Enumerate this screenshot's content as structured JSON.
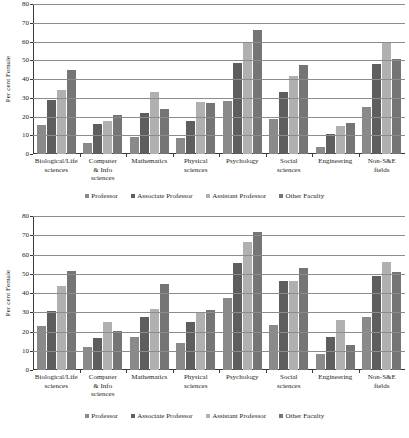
{
  "chart_data": [
    {
      "panel": "top",
      "type": "bar",
      "title": "",
      "xlabel": "",
      "ylabel": "Per cent Female",
      "ylim": [
        0,
        80
      ],
      "yticks": [
        0,
        10,
        20,
        30,
        40,
        50,
        60,
        70,
        80
      ],
      "grid": true,
      "legend_position": "bottom",
      "categories": [
        "Biological/Life sciences",
        "Computer & Info sciences",
        "Mathematics",
        "Physical sciences",
        "Psychology",
        "Social sciences",
        "Engineering",
        "Non-S&E fields"
      ],
      "category_lines": [
        [
          "Biological/Life",
          "sciences"
        ],
        [
          "Computer",
          "& Info",
          "sciences"
        ],
        [
          "Mathematics"
        ],
        [
          "Physical",
          "sciences"
        ],
        [
          "Psychology"
        ],
        [
          "Social",
          "sciences"
        ],
        [
          "Engineering"
        ],
        [
          "Non-S&E",
          "fields"
        ]
      ],
      "series": [
        {
          "name": "Professor",
          "color": "#8a8a8a",
          "values": [
            15.5,
            5.8,
            9.3,
            8.6,
            28.5,
            18.8,
            3.5,
            25.0
          ]
        },
        {
          "name": "Associate Professor",
          "color": "#5e5e5e",
          "values": [
            28.8,
            16.0,
            22.0,
            17.8,
            48.7,
            33.0,
            10.6,
            48.2
          ]
        },
        {
          "name": "Assistant Professor",
          "color": "#b0b0b0",
          "values": [
            34.2,
            17.8,
            33.2,
            27.7,
            59.2,
            41.7,
            15.1,
            59.5
          ]
        },
        {
          "name": "Other Faculty",
          "color": "#757575",
          "values": [
            45.0,
            20.9,
            24.1,
            27.3,
            66.2,
            47.7,
            16.7,
            50.8
          ]
        }
      ]
    },
    {
      "panel": "bottom",
      "type": "bar",
      "title": "",
      "xlabel": "",
      "ylabel": "Per cent Female",
      "ylim": [
        0,
        80
      ],
      "yticks": [
        0,
        10,
        20,
        30,
        40,
        50,
        60,
        70,
        80
      ],
      "grid": true,
      "legend_position": "bottom",
      "categories": [
        "Biological/Life sciences",
        "Computer & Info sciences",
        "Mathematics",
        "Physical sciences",
        "Psychology",
        "Social sciences",
        "Engineering",
        "Non-S&E fields"
      ],
      "category_lines": [
        [
          "Biological/Life",
          "sciences"
        ],
        [
          "Computer",
          "& Info",
          "sciences"
        ],
        [
          "Mathematics"
        ],
        [
          "Physical",
          "sciences"
        ],
        [
          "Psychology"
        ],
        [
          "Social",
          "sciences"
        ],
        [
          "Engineering"
        ],
        [
          "Non-S&E",
          "fields"
        ]
      ],
      "series": [
        {
          "name": "Professor",
          "color": "#8a8a8a",
          "values": [
            22.8,
            11.9,
            17.2,
            13.8,
            37.5,
            23.3,
            8.3,
            27.7
          ]
        },
        {
          "name": "Associate Professor",
          "color": "#5e5e5e",
          "values": [
            30.5,
            16.8,
            27.7,
            25.0,
            55.7,
            46.5,
            17.2,
            48.7
          ]
        },
        {
          "name": "Assistant Professor",
          "color": "#b0b0b0",
          "values": [
            43.4,
            25.0,
            31.6,
            30.2,
            66.6,
            46.4,
            25.8,
            56.1
          ]
        },
        {
          "name": "Other Faculty",
          "color": "#757575",
          "values": [
            51.5,
            20.2,
            44.7,
            31.3,
            71.9,
            52.8,
            13.2,
            51.1
          ]
        }
      ]
    }
  ],
  "legend": {
    "items": [
      {
        "label": "Professor",
        "color": "#8a8a8a"
      },
      {
        "label": "Associate Professor",
        "color": "#5e5e5e"
      },
      {
        "label": "Assistant Professor",
        "color": "#b0b0b0"
      },
      {
        "label": "Other Faculty",
        "color": "#757575"
      }
    ]
  }
}
